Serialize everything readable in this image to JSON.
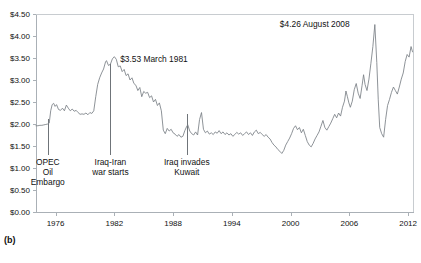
{
  "figure": {
    "panel_label": "(b)",
    "caption_fragment": ""
  },
  "chart_data": {
    "type": "line",
    "title": "",
    "xlabel": "",
    "ylabel": "",
    "xlim": [
      1974,
      2012.6
    ],
    "ylim": [
      0.0,
      4.5
    ],
    "grid": false,
    "legend": "none",
    "y_tick_labels": [
      "$4.50",
      "$4.00",
      "$3.50",
      "$3.00",
      "$2.50",
      "$2.00",
      "$1.50",
      "$1.00",
      "$0.50",
      "$0.00"
    ],
    "y_tick_values": [
      4.5,
      4.0,
      3.5,
      3.0,
      2.5,
      2.0,
      1.5,
      1.0,
      0.5,
      0.0
    ],
    "x_tick_labels": [
      "1976",
      "1982",
      "1988",
      "1994",
      "2000",
      "2006",
      "2012"
    ],
    "x_tick_values": [
      1976,
      1982,
      1988,
      1994,
      2000,
      2006,
      2012
    ],
    "annotations": [
      {
        "name": "peak-1981",
        "text": "$3.53 March 1981",
        "x": 1982.6,
        "y": 3.42,
        "value": 3.53,
        "date": "March 1981"
      },
      {
        "name": "peak-2008",
        "text": "$4.26 August 2008",
        "x": 1998.9,
        "y": 4.21,
        "value": 4.26,
        "date": "August 2008"
      }
    ],
    "event_markers": [
      {
        "name": "opec-oil-embargo",
        "label_lines": [
          "OPEC",
          "Oil",
          "Embargo"
        ],
        "x": 1975.2,
        "y_top": 2.12,
        "y_bottom": 1.3
      },
      {
        "name": "iraq-iran-war",
        "label_lines": [
          "Iraq-Iran",
          "war starts"
        ],
        "x": 1981.6,
        "y_top": 3.36,
        "y_bottom": 1.3
      },
      {
        "name": "iraq-invades-kuwait",
        "label_lines": [
          "Iraq invades",
          "Kuwait"
        ],
        "x": 1989.4,
        "y_top": 2.22,
        "y_bottom": 1.3
      }
    ],
    "series": [
      {
        "name": "Gasoline price (nominal, US dollars per gallon)",
        "x": [
          1974.0,
          1974.2,
          1974.4,
          1974.6,
          1974.8,
          1975.0,
          1975.2,
          1975.35,
          1975.5,
          1975.65,
          1975.8,
          1975.95,
          1976.1,
          1976.3,
          1976.5,
          1976.7,
          1976.9,
          1977.1,
          1977.3,
          1977.5,
          1977.7,
          1977.9,
          1978.1,
          1978.3,
          1978.5,
          1978.7,
          1978.9,
          1979.1,
          1979.3,
          1979.5,
          1979.7,
          1979.9,
          1980.1,
          1980.3,
          1980.5,
          1980.7,
          1980.9,
          1981.1,
          1981.2,
          1981.4,
          1981.6,
          1981.8,
          1982.0,
          1982.2,
          1982.4,
          1982.6,
          1982.8,
          1983.0,
          1983.2,
          1983.4,
          1983.6,
          1983.8,
          1984.0,
          1984.2,
          1984.4,
          1984.6,
          1984.8,
          1985.0,
          1985.2,
          1985.4,
          1985.6,
          1985.8,
          1986.0,
          1986.2,
          1986.4,
          1986.6,
          1986.8,
          1987.0,
          1987.2,
          1987.4,
          1987.6,
          1987.8,
          1988.0,
          1988.2,
          1988.4,
          1988.6,
          1988.8,
          1989.0,
          1989.2,
          1989.4,
          1989.5,
          1989.7,
          1989.9,
          1990.1,
          1990.3,
          1990.5,
          1990.7,
          1990.9,
          1991.1,
          1991.3,
          1991.5,
          1991.7,
          1991.9,
          1992.1,
          1992.3,
          1992.5,
          1992.7,
          1992.9,
          1993.1,
          1993.3,
          1993.5,
          1993.7,
          1993.9,
          1994.1,
          1994.3,
          1994.5,
          1994.7,
          1994.9,
          1995.1,
          1995.3,
          1995.5,
          1995.7,
          1995.9,
          1996.1,
          1996.3,
          1996.5,
          1996.7,
          1996.9,
          1997.1,
          1997.3,
          1997.5,
          1997.7,
          1997.9,
          1998.1,
          1998.3,
          1998.5,
          1998.7,
          1998.9,
          1999.1,
          1999.3,
          1999.5,
          1999.7,
          1999.9,
          2000.1,
          2000.3,
          2000.5,
          2000.7,
          2000.9,
          2001.1,
          2001.3,
          2001.5,
          2001.7,
          2001.9,
          2002.1,
          2002.3,
          2002.5,
          2002.7,
          2002.9,
          2003.1,
          2003.3,
          2003.5,
          2003.7,
          2003.9,
          2004.1,
          2004.3,
          2004.5,
          2004.7,
          2004.9,
          2005.1,
          2005.3,
          2005.5,
          2005.65,
          2005.8,
          2005.95,
          2006.1,
          2006.3,
          2006.5,
          2006.7,
          2006.9,
          2007.1,
          2007.3,
          2007.45,
          2007.6,
          2007.8,
          2008.0,
          2008.2,
          2008.4,
          2008.6,
          2008.8,
          2008.95,
          2009.1,
          2009.3,
          2009.5,
          2009.7,
          2009.9,
          2010.1,
          2010.3,
          2010.5,
          2010.7,
          2010.9,
          2011.1,
          2011.3,
          2011.5,
          2011.7,
          2011.9,
          2012.1,
          2012.3,
          2012.45
        ],
        "y": [
          1.96,
          1.96,
          1.97,
          1.97,
          1.98,
          1.99,
          2.0,
          2.02,
          2.3,
          2.44,
          2.47,
          2.4,
          2.44,
          2.33,
          2.31,
          2.36,
          2.3,
          2.43,
          2.36,
          2.3,
          2.34,
          2.29,
          2.31,
          2.26,
          2.22,
          2.23,
          2.22,
          2.25,
          2.21,
          2.26,
          2.24,
          2.3,
          2.62,
          2.9,
          3.05,
          3.16,
          3.25,
          3.41,
          3.44,
          3.33,
          3.36,
          3.48,
          3.53,
          3.47,
          3.3,
          3.32,
          3.19,
          3.24,
          3.1,
          3.14,
          3.0,
          3.05,
          2.92,
          2.88,
          2.76,
          2.83,
          2.62,
          2.74,
          2.7,
          2.72,
          2.6,
          2.64,
          2.5,
          2.56,
          2.42,
          2.48,
          2.3,
          1.86,
          1.78,
          1.9,
          1.84,
          1.88,
          1.8,
          1.77,
          1.72,
          1.76,
          1.7,
          1.72,
          1.85,
          1.95,
          1.98,
          1.84,
          1.78,
          1.75,
          1.82,
          1.75,
          2.1,
          2.26,
          1.88,
          1.8,
          1.84,
          1.77,
          1.8,
          1.76,
          1.82,
          1.79,
          1.85,
          1.78,
          1.82,
          1.76,
          1.8,
          1.75,
          1.78,
          1.72,
          1.76,
          1.81,
          1.77,
          1.8,
          1.74,
          1.78,
          1.82,
          1.76,
          1.8,
          1.74,
          1.82,
          1.86,
          1.78,
          1.81,
          1.76,
          1.72,
          1.76,
          1.7,
          1.66,
          1.58,
          1.52,
          1.48,
          1.42,
          1.38,
          1.33,
          1.4,
          1.52,
          1.6,
          1.68,
          1.78,
          1.9,
          1.96,
          1.87,
          1.92,
          1.8,
          1.88,
          1.74,
          1.6,
          1.52,
          1.48,
          1.56,
          1.66,
          1.74,
          1.82,
          1.95,
          2.08,
          1.92,
          1.86,
          1.94,
          2.02,
          2.12,
          2.22,
          2.14,
          2.25,
          2.18,
          2.38,
          2.52,
          2.75,
          2.62,
          2.48,
          2.38,
          2.52,
          2.78,
          2.92,
          2.7,
          2.58,
          2.88,
          3.12,
          2.9,
          2.76,
          3.02,
          3.38,
          3.76,
          4.26,
          3.4,
          2.55,
          1.92,
          1.78,
          1.7,
          2.1,
          2.42,
          2.56,
          2.72,
          2.84,
          2.76,
          2.68,
          2.84,
          3.02,
          3.16,
          3.42,
          3.58,
          3.52,
          3.76,
          3.64
        ]
      }
    ]
  },
  "axis_geometry": {
    "plot_left_px": 36,
    "plot_right_px": 414,
    "plot_top_px": 14,
    "plot_bottom_px": 212
  }
}
